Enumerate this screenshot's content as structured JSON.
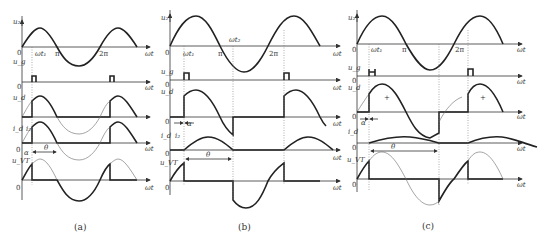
{
  "figure": {
    "panels": [
      {
        "id": "a",
        "caption": "(a)",
        "signals": [
          "u2",
          "ug",
          "ud",
          "id",
          "uVT"
        ],
        "labels": {
          "u2": "u₂",
          "ug": "u_g",
          "ud": "u_d",
          "id": "i_d",
          "i2": "i₂",
          "uVT": "u_VT",
          "zero": "0",
          "wt": "ωt",
          "wt1": "ωt₁",
          "pi": "π",
          "twopi": "2π",
          "alpha": "α",
          "theta": "θ"
        }
      },
      {
        "id": "b",
        "caption": "(b)",
        "signals": [
          "u2",
          "ug",
          "ud",
          "id",
          "uVT"
        ],
        "labels": {
          "u2": "u₂",
          "ug": "u_g",
          "ud": "u_d",
          "id": "i_d",
          "i2": "i₂",
          "uVT": "u_VT",
          "zero": "0",
          "wt": "ωt",
          "wt1": "ωt₁",
          "wt2": "ωt₂",
          "pi": "π",
          "twopi": "2π",
          "alpha": "α",
          "theta": "θ"
        }
      },
      {
        "id": "c",
        "caption": "(c)",
        "signals": [
          "u2",
          "ug",
          "ud",
          "id",
          "uVT"
        ],
        "labels": {
          "u2": "u₂",
          "ug": "u_g",
          "ud": "u_d",
          "id": "i_d",
          "uVT": "u_VT",
          "zero": "0",
          "wt": "ωt",
          "wt1": "ωt₁",
          "pi": "π",
          "twopi": "2π",
          "alpha": "α",
          "theta": "θ",
          "plus": "+"
        }
      }
    ]
  }
}
